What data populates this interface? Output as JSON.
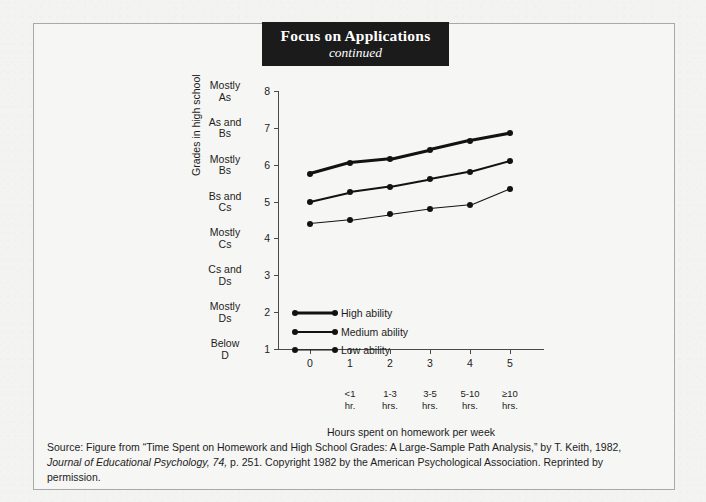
{
  "banner": {
    "title": "Focus on Applications",
    "subtitle": "continued"
  },
  "chart_data": {
    "type": "line",
    "title": "",
    "xlabel": "Hours spent on homework per week",
    "ylabel": "Grades in high school",
    "x": [
      0,
      1,
      2,
      3,
      4,
      5
    ],
    "xtick_labels": [
      "0",
      "1",
      "2",
      "3",
      "4",
      "5"
    ],
    "x_sublabels": [
      "",
      "<1 hr.",
      "1-3 hrs.",
      "3-5 hrs.",
      "5-10 hrs.",
      "≥10 hrs."
    ],
    "xlim": [
      0,
      5
    ],
    "ylim": [
      1,
      8
    ],
    "ytick_values": [
      1,
      2,
      3,
      4,
      5,
      6,
      7,
      8
    ],
    "ytick_labels": [
      "1",
      "2",
      "3",
      "4",
      "5",
      "6",
      "7",
      "8"
    ],
    "y_category_labels": [
      "Below\nD",
      "Mostly\nDs",
      "Cs and\nDs",
      "Mostly\nCs",
      "Bs and\nCs",
      "Mostly\nBs",
      "As and\nBs",
      "Mostly\nAs"
    ],
    "grid": false,
    "legend_position": "inside-lower-left",
    "series": [
      {
        "name": "High ability",
        "values": [
          5.75,
          6.05,
          6.15,
          6.4,
          6.65,
          6.85
        ],
        "line_width": 3
      },
      {
        "name": "Medium ability",
        "values": [
          5.0,
          5.25,
          5.4,
          5.6,
          5.8,
          6.1
        ],
        "line_width": 2
      },
      {
        "name": "Low ability",
        "values": [
          4.4,
          4.5,
          4.65,
          4.8,
          4.9,
          5.35
        ],
        "line_width": 1
      }
    ]
  },
  "source": {
    "line1_pre": "Source: Figure from “Time Spent on Homework and High School Grades: A Large-Sample Path Analysis,” by T. Keith, 1982,",
    "journal": "Journal of Educational Psychology, 74,",
    "line2_post": " p. 251. Copyright 1982 by the American Psychological Association. Reprinted by permission."
  }
}
